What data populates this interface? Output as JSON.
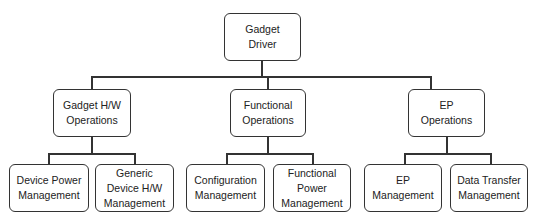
{
  "diagram": {
    "type": "hierarchy-tree",
    "root": {
      "label_lines": [
        "Gadget",
        "Driver"
      ],
      "children": [
        {
          "label_lines": [
            "Gadget H/W",
            "Operations"
          ],
          "children": [
            {
              "label_lines": [
                "Device Power",
                "Management"
              ]
            },
            {
              "label_lines": [
                "Generic",
                "Device H/W",
                "Management"
              ]
            }
          ]
        },
        {
          "label_lines": [
            "Functional",
            "Operations"
          ],
          "children": [
            {
              "label_lines": [
                "Configuration",
                "Management"
              ]
            },
            {
              "label_lines": [
                "Functional",
                "Power",
                "Management"
              ]
            }
          ]
        },
        {
          "label_lines": [
            "EP",
            "Operations"
          ],
          "children": [
            {
              "label_lines": [
                "EP",
                "Management"
              ]
            },
            {
              "label_lines": [
                "Data Transfer",
                "Management"
              ]
            }
          ]
        }
      ]
    }
  }
}
